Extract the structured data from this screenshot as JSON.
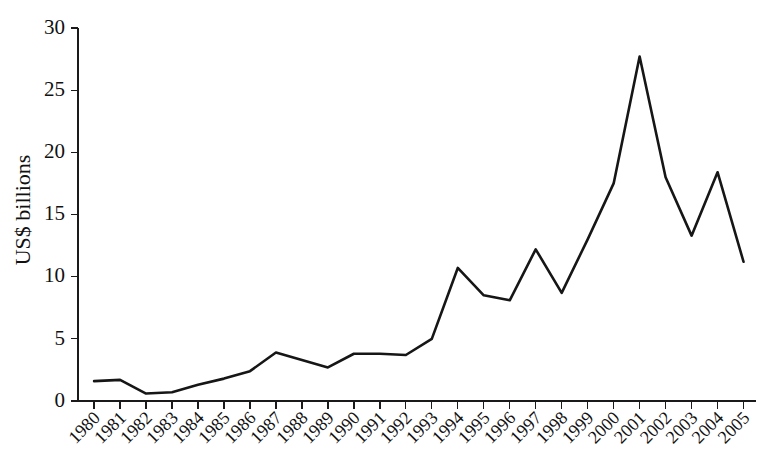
{
  "chart_data": {
    "type": "line",
    "title": "",
    "xlabel": "",
    "ylabel": "US$ billions",
    "categories": [
      "1980",
      "1981",
      "1982",
      "1983",
      "1984",
      "1985",
      "1986",
      "1987",
      "1988",
      "1989",
      "1990",
      "1991",
      "1992",
      "1993",
      "1994",
      "1995",
      "1996",
      "1997",
      "1998",
      "1999",
      "2000",
      "2001",
      "2002",
      "2003",
      "2004",
      "2005"
    ],
    "values": [
      1.6,
      1.7,
      0.6,
      0.7,
      1.3,
      1.8,
      2.4,
      3.9,
      3.3,
      2.7,
      3.8,
      3.8,
      3.7,
      5.0,
      10.7,
      8.5,
      8.1,
      12.2,
      8.7,
      13.0,
      17.5,
      27.7,
      18.0,
      13.3,
      18.4,
      11.2
    ],
    "series": [
      {
        "name": "US$ billions",
        "values": [
          1.6,
          1.7,
          0.6,
          0.7,
          1.3,
          1.8,
          2.4,
          3.9,
          3.3,
          2.7,
          3.8,
          3.8,
          3.7,
          5.0,
          10.7,
          8.5,
          8.1,
          12.2,
          8.7,
          13.0,
          17.5,
          27.7,
          18.0,
          13.3,
          18.4,
          11.2
        ]
      }
    ],
    "ylim": [
      0,
      30
    ],
    "yticks": [
      0,
      5,
      10,
      15,
      20,
      25,
      30
    ],
    "ytick_labels": [
      "0",
      "5",
      "10",
      "15",
      "20",
      "25",
      "30"
    ],
    "xtick_labels": [
      "1980",
      "1981",
      "1982",
      "1983",
      "1984",
      "1985",
      "1986",
      "1987",
      "1988",
      "1989",
      "1990",
      "1991",
      "1992",
      "1993",
      "1994",
      "1995",
      "1996",
      "1997",
      "1998",
      "1999",
      "2000",
      "2001",
      "2002",
      "2003",
      "2004",
      "2005"
    ],
    "grid": false,
    "legend": false,
    "line_color": "#161616",
    "axis_color": "#1a1a1a",
    "background_color": "#ffffff",
    "xtick_label_rotation": "-45"
  }
}
